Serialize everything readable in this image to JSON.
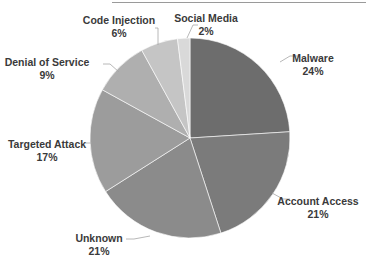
{
  "chart_data": {
    "type": "pie",
    "title": "",
    "start_angle_deg": 0,
    "direction": "clockwise",
    "categories": [
      "Malware",
      "Account Access",
      "Unknown",
      "Targeted Attack",
      "Denial of Service",
      "Code Injection",
      "Social Media"
    ],
    "values": [
      24,
      21,
      21,
      17,
      9,
      6,
      2
    ],
    "value_labels": [
      "24%",
      "21%",
      "21%",
      "17%",
      "9%",
      "6%",
      "2%"
    ],
    "colors": [
      "#6d6d6d",
      "#7b7b7b",
      "#8b8b8b",
      "#9c9c9c",
      "#afafaf",
      "#c5c5c5",
      "#d9d9d9"
    ],
    "legend": "none (data labels with leader lines)",
    "geometry": {
      "cx": 190,
      "cy": 138,
      "r": 100
    }
  },
  "labels": [
    {
      "name": "Malware",
      "pct": "24%",
      "x": 313,
      "y": 52,
      "line": [
        [
          280,
          62
        ],
        [
          290,
          56
        ],
        [
          298,
          56
        ]
      ]
    },
    {
      "name": "Account Access",
      "pct": "21%",
      "x": 318,
      "y": 195,
      "line": [
        [
          272,
          193
        ],
        [
          283,
          199
        ],
        [
          290,
          199
        ]
      ]
    },
    {
      "name": "Unknown",
      "pct": "21%",
      "x": 99,
      "y": 232,
      "line": [
        [
          150,
          236
        ],
        [
          134,
          239
        ],
        [
          126,
          239
        ]
      ]
    },
    {
      "name": "Targeted Attack",
      "pct": "17%",
      "x": 47,
      "y": 138,
      "line": [
        [
          92,
          143
        ],
        [
          85,
          143
        ]
      ]
    },
    {
      "name": "Denial of Service",
      "pct": "9%",
      "x": 47,
      "y": 56,
      "line": [
        [
          119,
          72
        ],
        [
          110,
          64
        ],
        [
          103,
          64
        ]
      ]
    },
    {
      "name": "Code Injection",
      "pct": "6%",
      "x": 119,
      "y": 14,
      "line": [
        [
          158,
          45
        ],
        [
          158,
          28
        ],
        [
          155,
          28
        ]
      ]
    },
    {
      "name": "Social Media",
      "pct": "2%",
      "x": 206,
      "y": 12,
      "line": [
        [
          187,
          38
        ],
        [
          193,
          25
        ],
        [
          198,
          25
        ]
      ]
    }
  ]
}
